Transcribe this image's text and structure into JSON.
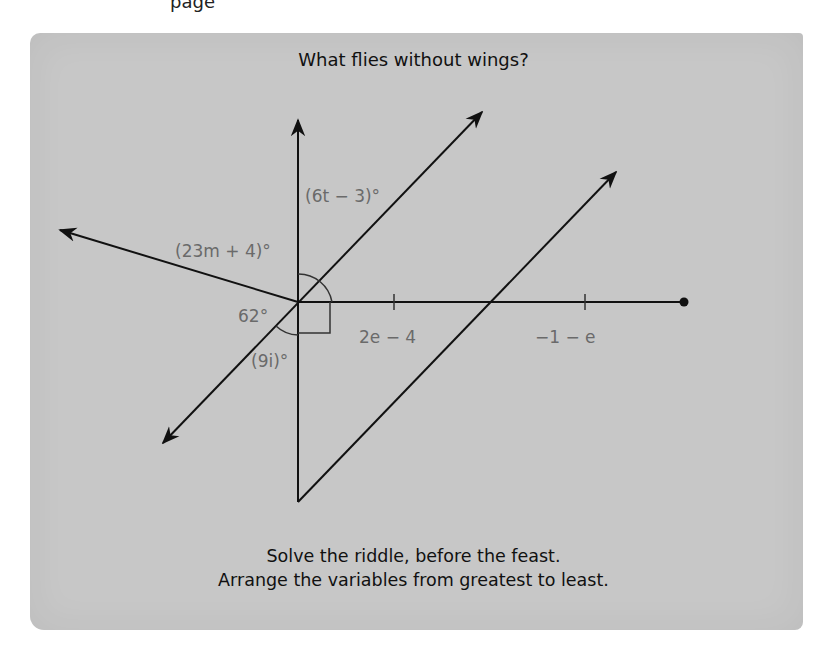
{
  "page_fragment_top": "page",
  "puzzle": {
    "title": "What flies without wings?",
    "footer_line1": "Solve the riddle, before the feast.",
    "footer_line2": "Arrange the variables from greatest to least."
  },
  "diagram": {
    "angle_labels": {
      "six_t": "(6t − 3)°",
      "twentythree_m": "(23m + 4)°",
      "sixty_two": "62°",
      "nine_i": "(9i)°"
    },
    "segment_labels": {
      "first": "2e − 4",
      "second": "−1 − e"
    },
    "colors": {
      "panel": "#c7c7c7",
      "line": "#111111",
      "label": "#6a6a6a"
    }
  }
}
